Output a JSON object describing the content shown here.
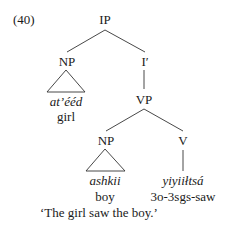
{
  "example_number": "(40)",
  "tree": {
    "root": "IP",
    "subject_np": {
      "label": "NP",
      "word": "at’ééd",
      "gloss": "girl"
    },
    "i_bar": "I′",
    "vp": {
      "label": "VP",
      "object_np": {
        "label": "NP",
        "word": "ashkii",
        "gloss": "boy"
      },
      "verb": {
        "label": "V",
        "word": "yiyiiłtsá",
        "gloss": "3o-3sgs-saw"
      }
    }
  },
  "translation": "‘The girl saw the boy.’"
}
